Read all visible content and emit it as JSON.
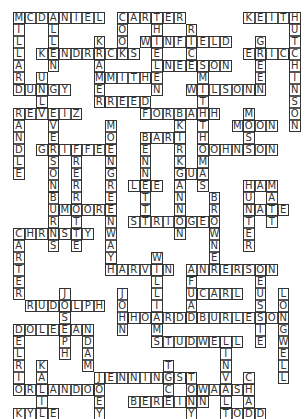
{
  "puzzle": {
    "type": "crossword",
    "grid": {
      "origin_x": 13,
      "origin_y": 12,
      "cell_w": 11.5,
      "cell_h": 12
    },
    "words": [
      {
        "text": "MCDANIEL",
        "col": 0,
        "row": 0,
        "dir": "across"
      },
      {
        "text": "CARTER",
        "col": 9,
        "row": 0,
        "dir": "across"
      },
      {
        "text": "KEITH",
        "col": 20,
        "row": 0,
        "dir": "across"
      },
      {
        "text": "MILLARD",
        "col": 0,
        "row": 0,
        "dir": "down"
      },
      {
        "text": "ALLEN",
        "col": 3,
        "row": 0,
        "dir": "down"
      },
      {
        "text": "COOK",
        "col": 9,
        "row": 0,
        "dir": "down"
      },
      {
        "text": "THIELEN",
        "col": 12,
        "row": 0,
        "dir": "down"
      },
      {
        "text": "HUTCHINSON",
        "col": 24,
        "row": 0,
        "dir": "down"
      },
      {
        "text": "RICE",
        "col": 15,
        "row": 1,
        "dir": "down"
      },
      {
        "text": "WINFIELD",
        "col": 11,
        "row": 2,
        "dir": "across"
      },
      {
        "text": "KRAMER",
        "col": 7,
        "row": 2,
        "dir": "down"
      },
      {
        "text": "KENDRICKS",
        "col": 2,
        "row": 3,
        "dir": "across"
      },
      {
        "text": "GREEN",
        "col": 21,
        "row": 2,
        "dir": "down"
      },
      {
        "text": "ERIC",
        "col": 20,
        "row": 3,
        "dir": "across"
      },
      {
        "text": "NELSON",
        "col": 13,
        "row": 4,
        "dir": "across"
      },
      {
        "text": "SMITH",
        "col": 16,
        "row": 4,
        "dir": "down"
      },
      {
        "text": "SMITH",
        "col": 7,
        "row": 5,
        "dir": "across"
      },
      {
        "text": "WILSON",
        "col": 15,
        "row": 6,
        "dir": "across"
      },
      {
        "text": "DUNGY",
        "col": 0,
        "row": 6,
        "dir": "across"
      },
      {
        "text": "UNL",
        "col": 2,
        "row": 5,
        "dir": "down"
      },
      {
        "text": "REED",
        "col": 8,
        "row": 7,
        "dir": "across"
      },
      {
        "text": "REVEIZ",
        "col": 0,
        "row": 8,
        "dir": "across"
      },
      {
        "text": "RANDLE",
        "col": 0,
        "row": 8,
        "dir": "down"
      },
      {
        "text": "FORBATH",
        "col": 11,
        "row": 8,
        "dir": "across"
      },
      {
        "text": "MOSS",
        "col": 20,
        "row": 8,
        "dir": "down"
      },
      {
        "text": "MOEN",
        "col": 8,
        "row": 9,
        "dir": "down"
      },
      {
        "text": "VERSON",
        "col": 3,
        "row": 9,
        "dir": "down"
      },
      {
        "text": "MOON",
        "col": 19,
        "row": 9,
        "dir": "across"
      },
      {
        "text": "THOMAS",
        "col": 16,
        "row": 9,
        "dir": "down"
      },
      {
        "text": "KIRK",
        "col": 14,
        "row": 9,
        "dir": "down"
      },
      {
        "text": "BARR",
        "col": 11,
        "row": 10,
        "dir": "across"
      },
      {
        "text": "BENNETT",
        "col": 11,
        "row": 10,
        "dir": "down"
      },
      {
        "text": "GRIFFEN",
        "col": 2,
        "row": 11,
        "dir": "across"
      },
      {
        "text": "JOHNSON",
        "col": 16,
        "row": 11,
        "dir": "across"
      },
      {
        "text": "FRERROTTE",
        "col": 5,
        "row": 11,
        "dir": "down"
      },
      {
        "text": "GREENWAY",
        "col": 8,
        "row": 13,
        "dir": "down"
      },
      {
        "text": "GUS",
        "col": 14,
        "row": 13,
        "dir": "across"
      },
      {
        "text": "GANNON",
        "col": 14,
        "row": 13,
        "dir": "down"
      },
      {
        "text": "LEE",
        "col": 10,
        "row": 14,
        "dir": "across"
      },
      {
        "text": "HAM",
        "col": 20,
        "row": 14,
        "dir": "across"
      },
      {
        "text": "HUNTER",
        "col": 20,
        "row": 14,
        "dir": "down"
      },
      {
        "text": "MATT",
        "col": 22,
        "row": 14,
        "dir": "down"
      },
      {
        "text": "BROWNER",
        "col": 17,
        "row": 15,
        "dir": "down"
      },
      {
        "text": "MOORE",
        "col": 4,
        "row": 16,
        "dir": "across"
      },
      {
        "text": "BURNS",
        "col": 3,
        "row": 15,
        "dir": "down"
      },
      {
        "text": "STRINGER",
        "col": 10,
        "row": 17,
        "dir": "across"
      },
      {
        "text": "NATE",
        "col": 20,
        "row": 16,
        "dir": "across"
      },
      {
        "text": "CHRISTY",
        "col": 0,
        "row": 18,
        "dir": "across"
      },
      {
        "text": "CARTER",
        "col": 0,
        "row": 18,
        "dir": "down"
      },
      {
        "text": "WILLIAMS",
        "col": 12,
        "row": 20,
        "dir": "down"
      },
      {
        "text": "HARVIN",
        "col": 8,
        "row": 21,
        "dir": "across"
      },
      {
        "text": "ANDERSON",
        "col": 15,
        "row": 21,
        "dir": "across"
      },
      {
        "text": "FUAD",
        "col": 15,
        "row": 22,
        "dir": "down"
      },
      {
        "text": "CARL",
        "col": 16,
        "row": 23,
        "dir": "across"
      },
      {
        "text": "TEUSSIE",
        "col": 21,
        "row": 21,
        "dir": "down"
      },
      {
        "text": "JOHN",
        "col": 9,
        "row": 23,
        "dir": "down"
      },
      {
        "text": "JOSEPH",
        "col": 4,
        "row": 23,
        "dir": "down"
      },
      {
        "text": "LONGWELL",
        "col": 23,
        "row": 23,
        "dir": "down"
      },
      {
        "text": "RUDOLPH",
        "col": 1,
        "row": 24,
        "dir": "across"
      },
      {
        "text": "HOARD",
        "col": 10,
        "row": 25,
        "dir": "across"
      },
      {
        "text": "BURLESON",
        "col": 16,
        "row": 25,
        "dir": "across"
      },
      {
        "text": "DOLEMAN",
        "col": 0,
        "row": 26,
        "dir": "across"
      },
      {
        "text": "ADAM",
        "col": 6,
        "row": 26,
        "dir": "down"
      },
      {
        "text": "STUDWELL",
        "col": 12,
        "row": 27,
        "dir": "across"
      },
      {
        "text": "DELRIO",
        "col": 0,
        "row": 26,
        "dir": "down"
      },
      {
        "text": "LINVAL",
        "col": 18,
        "row": 27,
        "dir": "down"
      },
      {
        "text": "KALIL",
        "col": 2,
        "row": 29,
        "dir": "down"
      },
      {
        "text": "JENNINGS",
        "col": 7,
        "row": 30,
        "dir": "across"
      },
      {
        "text": "TICE",
        "col": 13,
        "row": 29,
        "dir": "down"
      },
      {
        "text": "JOEY",
        "col": 7,
        "row": 30,
        "dir": "down"
      },
      {
        "text": "TONY",
        "col": 15,
        "row": 30,
        "dir": "down"
      },
      {
        "text": "CHAD",
        "col": 20,
        "row": 30,
        "dir": "down"
      },
      {
        "text": "ORLANDO",
        "col": 0,
        "row": 31,
        "dir": "across"
      },
      {
        "text": "WALSH",
        "col": 16,
        "row": 31,
        "dir": "across"
      },
      {
        "text": "BERRIAN",
        "col": 10,
        "row": 32,
        "dir": "across"
      },
      {
        "text": "KYLE",
        "col": 0,
        "row": 33,
        "dir": "across"
      },
      {
        "text": "TODD",
        "col": 18,
        "row": 33,
        "dir": "across"
      }
    ]
  }
}
